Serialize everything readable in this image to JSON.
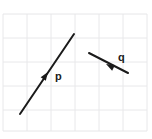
{
  "figure": {
    "background_color": "#ffffff",
    "grid": {
      "visible": true,
      "color": "#e8e8ea",
      "line_width": 1,
      "spacing": 24,
      "x_lines": [
        3,
        27,
        51,
        75,
        99,
        123,
        147
      ],
      "y_lines": [
        14,
        38,
        62,
        86,
        110,
        131
      ],
      "border_color": "#e4e4e6"
    },
    "vectors": [
      {
        "name": "p",
        "label": "p",
        "label_x": 55,
        "label_y": 80,
        "color": "#1a1a1a",
        "line_width": 2,
        "tail_x": 20,
        "tail_y": 114,
        "tip_x": 74,
        "tip_y": 34,
        "arrowhead_x": 48,
        "arrowhead_y": 72,
        "direction": "up-right",
        "grid_run": 2.25,
        "grid_rise": 3.33
      },
      {
        "name": "q",
        "label": "q",
        "label_x": 118,
        "label_y": 61,
        "color": "#1a1a1a",
        "line_width": 2,
        "tail_x": 128,
        "tail_y": 73,
        "tip_x": 89,
        "tip_y": 53,
        "arrowhead_x": 106,
        "arrowhead_y": 64,
        "direction": "left-up",
        "grid_run": -1.63,
        "grid_rise": 0.83
      }
    ]
  }
}
